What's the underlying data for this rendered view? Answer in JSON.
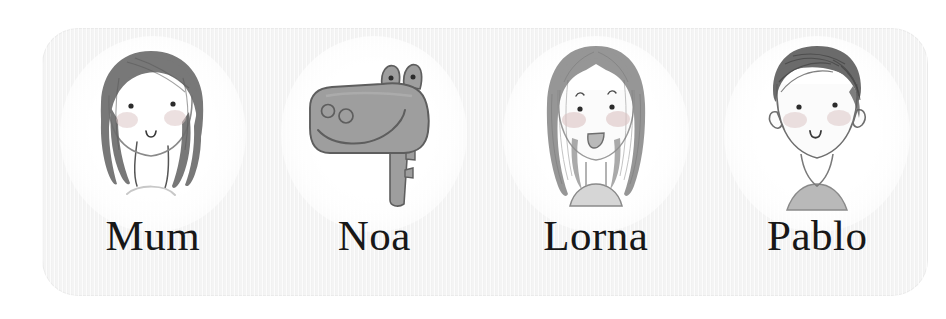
{
  "card": {
    "background_color": "#f4f4f4",
    "corner_radius_px": 36
  },
  "characters": [
    {
      "id": "mum",
      "name": "Mum",
      "avatar_icon": "mum-portrait-icon",
      "description": "woman with chin-length dark bob hair, dot eyes, rosy cheeks, small smile",
      "hair_color": "#6e6e6e",
      "skin_color": "#fbfbfb",
      "cheek_color": "#dcc6c6"
    },
    {
      "id": "noa",
      "name": "Noa",
      "avatar_icon": "noa-hippo-icon",
      "description": "grey hippo head in profile with two eye bumps, two nostrils and a long smile",
      "hair_color": "#9a9a9a",
      "skin_color": "#9e9e9e",
      "cheek_color": "#9a9a9a"
    },
    {
      "id": "lorna",
      "name": "Lorna",
      "avatar_icon": "lorna-portrait-icon",
      "description": "girl with long centre-parted hair, eyebrows, rosy cheeks and open smiling mouth",
      "hair_color": "#8e8e8e",
      "skin_color": "#fbfbfb",
      "cheek_color": "#dcc3c3"
    },
    {
      "id": "pablo",
      "name": "Pablo",
      "avatar_icon": "pablo-portrait-icon",
      "description": "boy with short scribbled dark hair, big ears, rosy cheeks and a small smile",
      "hair_color": "#5f5f5f",
      "skin_color": "#fbfbfb",
      "cheek_color": "#dcc6c6"
    }
  ]
}
